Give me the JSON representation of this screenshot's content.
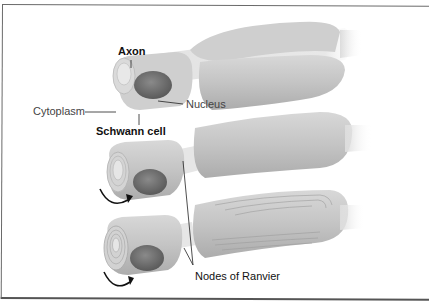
{
  "diagram": {
    "labels": {
      "axon": "Axon",
      "cytoplasm": "Cytoplasm",
      "nucleus": "Nucleus",
      "schwann_cell": "Schwann cell",
      "nodes_of_ranvier": "Nodes of Ranvier"
    },
    "stages": [
      {
        "id": "stage-1",
        "description": "Schwann cell begins wrapping around axon"
      },
      {
        "id": "stage-2",
        "description": "Schwann cell rotates, forming membrane layers"
      },
      {
        "id": "stage-3",
        "description": "Multiple layers form the myelin sheath"
      }
    ],
    "colors": {
      "cell_fill": "#c9c9c9",
      "cell_shadow": "#a9a9a9",
      "nucleus": "#6e6e6e",
      "axon": "#e4e4e4",
      "leader_line": "#222222",
      "arrow": "#111111"
    }
  }
}
